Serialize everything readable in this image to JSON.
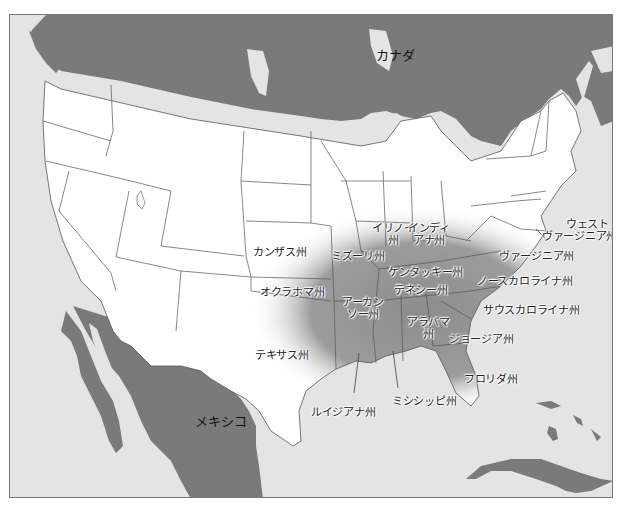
{
  "map": {
    "type": "regional map",
    "colors": {
      "ocean": "#e4e4e4",
      "foreign_land": "#7a7a7a",
      "us_land": "#ffffff",
      "highlight_dark": "#8a8a8a",
      "highlight_fade": "#bdbdbd",
      "border": "#555555"
    },
    "countries": [
      {
        "name": "カナダ"
      },
      {
        "name": "メキシコ"
      }
    ],
    "states": [
      {
        "name": "カンザス州",
        "highlighted": false
      },
      {
        "name": "オクラホマ州",
        "highlighted": false
      },
      {
        "name": "テキサス州",
        "highlighted": false
      },
      {
        "name": "ミズーリ州",
        "highlighted": true
      },
      {
        "name": "イリノイ",
        "line2": "州",
        "highlighted": false
      },
      {
        "name": "インディ",
        "line2": "アナ州",
        "highlighted": false
      },
      {
        "name": "ケンタッキー州",
        "highlighted": true
      },
      {
        "name": "テネシー州",
        "highlighted": true
      },
      {
        "name": "アーカン",
        "line2": "ソー州",
        "highlighted": true
      },
      {
        "name": "アラバマ",
        "line2": "州",
        "highlighted": true
      },
      {
        "name": "ジョージア州",
        "highlighted": true
      },
      {
        "name": "ルイジアナ州",
        "highlighted": true
      },
      {
        "name": "ミシシッピ州",
        "highlighted": true
      },
      {
        "name": "フロリダ州",
        "highlighted": true
      },
      {
        "name": "ウェスト",
        "line2": "ヴァージニア州",
        "highlighted": false
      },
      {
        "name": "ヴァージニア州",
        "highlighted": true
      },
      {
        "name": "ノースカロライナ州",
        "highlighted": true
      },
      {
        "name": "サウスカロライナ州",
        "highlighted": true
      }
    ]
  }
}
